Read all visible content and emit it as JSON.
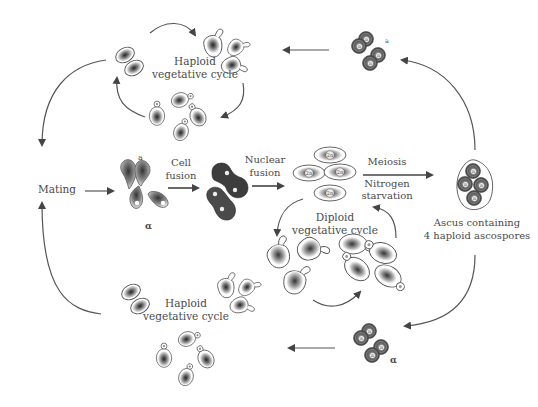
{
  "diagram": {
    "labels": {
      "haploid_top_line1": "Haploid",
      "haploid_top_line2": "vegetative cycle",
      "haploid_bottom_line1": "Haploid",
      "haploid_bottom_line2": "vegetative cycle",
      "diploid_line1": "Diploid",
      "diploid_line2": "vegetative cycle",
      "mating": "Mating",
      "cell_fusion_line1": "Cell",
      "cell_fusion_line2": "fusion",
      "nuclear_fusion_line1": "Nuclear",
      "nuclear_fusion_line2": "fusion",
      "meiosis": "Meiosis",
      "nitrogen_line1": "Nitrogen",
      "nitrogen_line2": "starvation",
      "ascus_line1": "Ascus containing",
      "ascus_line2": "4 haploid ascospores",
      "mating_type_a_top": "a",
      "mating_type_a_mating": "a",
      "mating_type_alpha_mating": "α",
      "mating_type_alpha_bottom": "α",
      "diploid_nucleus": "2n",
      "haploid_nucleus": "n"
    },
    "nodes": [
      {
        "id": "haploid-a-cycle",
        "label": "Haploid vegetative cycle (a)"
      },
      {
        "id": "haploid-alpha-cycle",
        "label": "Haploid vegetative cycle (α)"
      },
      {
        "id": "mating",
        "label": "Mating"
      },
      {
        "id": "mating-cells",
        "label": "a and α cells"
      },
      {
        "id": "fused-cells",
        "label": "Cell fusion product"
      },
      {
        "id": "diploid-cells",
        "label": "Diploid 2n cells"
      },
      {
        "id": "diploid-cycle",
        "label": "Diploid vegetative cycle"
      },
      {
        "id": "ascus",
        "label": "Ascus containing 4 haploid ascospores"
      },
      {
        "id": "spores-a",
        "label": "a spores"
      },
      {
        "id": "spores-alpha",
        "label": "α spores"
      }
    ],
    "edges": [
      {
        "from": "haploid-a-cycle",
        "to": "mating"
      },
      {
        "from": "haploid-alpha-cycle",
        "to": "mating"
      },
      {
        "from": "mating",
        "to": "mating-cells"
      },
      {
        "from": "mating-cells",
        "to": "fused-cells",
        "label": "Cell fusion"
      },
      {
        "from": "fused-cells",
        "to": "diploid-cells",
        "label": "Nuclear fusion"
      },
      {
        "from": "diploid-cells",
        "to": "ascus",
        "label": "Meiosis / Nitrogen starvation"
      },
      {
        "from": "ascus",
        "to": "spores-a"
      },
      {
        "from": "ascus",
        "to": "spores-alpha"
      },
      {
        "from": "spores-a",
        "to": "haploid-a-cycle"
      },
      {
        "from": "spores-alpha",
        "to": "haploid-alpha-cycle"
      }
    ],
    "colors": {
      "text": "#4a4a4a",
      "arrow": "#555555",
      "cell_dark": "#3a3a3a",
      "cell_mid": "#8a8a8a",
      "background": "#ffffff"
    }
  }
}
